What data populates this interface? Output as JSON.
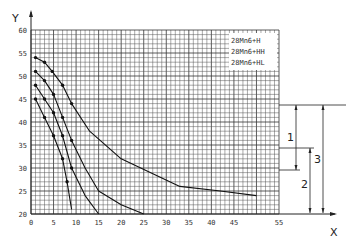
{
  "chart_data": {
    "type": "line",
    "title": "",
    "xlabel": "X",
    "ylabel": "Y",
    "xlim": [
      0,
      55
    ],
    "ylim": [
      20,
      60
    ],
    "grid": true,
    "x_ticks": [
      "0",
      "5",
      "10",
      "15",
      "20",
      "25",
      "30",
      "35",
      "40",
      "45",
      "55"
    ],
    "y_ticks": [
      "20",
      "25",
      "30",
      "35",
      "40",
      "45",
      "50",
      "55",
      "60"
    ],
    "legend": [
      "28Mn6+H",
      "28Mn6+HH",
      "28Mn6+HL"
    ],
    "legend_position": "upper right",
    "series": [
      {
        "name": "curve-1",
        "points": [
          [
            1,
            54
          ],
          [
            3,
            53
          ],
          [
            4.7,
            51
          ],
          [
            7,
            48
          ],
          [
            9,
            44
          ],
          [
            13,
            38
          ],
          [
            20,
            32
          ],
          [
            33,
            26
          ],
          [
            42,
            25
          ],
          [
            50,
            24
          ]
        ]
      },
      {
        "name": "curve-2",
        "points": [
          [
            1,
            51
          ],
          [
            3,
            49
          ],
          [
            5,
            46
          ],
          [
            7,
            41
          ],
          [
            9,
            36
          ],
          [
            12,
            30
          ],
          [
            15,
            25
          ],
          [
            20,
            22
          ],
          [
            25,
            20
          ]
        ]
      },
      {
        "name": "curve-3",
        "points": [
          [
            1,
            48
          ],
          [
            3,
            45
          ],
          [
            5,
            42
          ],
          [
            7,
            37
          ],
          [
            9,
            30
          ],
          [
            12,
            24
          ],
          [
            15,
            20
          ]
        ]
      },
      {
        "name": "curve-4",
        "points": [
          [
            1,
            45
          ],
          [
            3,
            41
          ],
          [
            5,
            37
          ],
          [
            7,
            32
          ],
          [
            8,
            27
          ],
          [
            9,
            21
          ]
        ]
      }
    ],
    "annotations": [
      {
        "label": "1",
        "type": "dimension",
        "from_y": 43,
        "to_y": 32
      },
      {
        "label": "2",
        "type": "dimension",
        "from_y": 34,
        "to_y": 20
      },
      {
        "label": "3",
        "type": "dimension",
        "from_y": 43,
        "to_y": 20
      }
    ]
  }
}
